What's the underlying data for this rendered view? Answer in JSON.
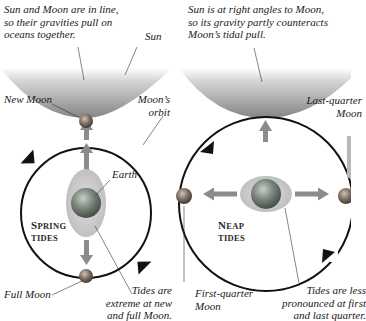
{
  "diagram": {
    "panels": [
      {
        "id": "spring",
        "caption_top": "Sun and Moon are in line, so their gravities pull on oceans together.",
        "caption_lines": [
          "Sun and Moon are in line,",
          "so their gravities pull on",
          "oceans together."
        ],
        "sun_label": "Sun",
        "new_moon_label": "New Moon",
        "orbit_label_lines": [
          "Moon’s",
          "orbit"
        ],
        "earth_label": "Earth",
        "tide_type_lines": [
          "Spring",
          "tides"
        ],
        "full_moon_label": "Full Moon",
        "note_lines": [
          "Tides are",
          "extreme at new",
          "and full Moon."
        ]
      },
      {
        "id": "neap",
        "caption_lines": [
          "Sun is at right angles to Moon,",
          "so its gravity partly counteracts",
          "Moon’s tidal pull."
        ],
        "last_quarter_label_lines": [
          "Last-quarter",
          "Moon"
        ],
        "tide_type_lines": [
          "Neap",
          "tides"
        ],
        "first_quarter_label_lines": [
          "First-quarter",
          "Moon"
        ],
        "note_lines": [
          "Tides are less",
          "pronounced at first",
          "and last quarter."
        ]
      }
    ],
    "colors": {
      "sun_gradient_top": "#ffffff",
      "sun_gradient_bottom": "#8a8a8a",
      "orbit": "#111111",
      "gravity_arrow": "#8c8c8c",
      "tidal_bulge": "#c8c8c8",
      "earth": "#6f7a73",
      "moon": "#7a7068"
    }
  }
}
